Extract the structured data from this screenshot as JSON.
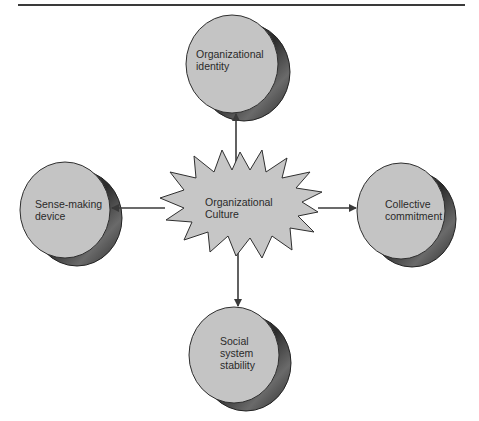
{
  "diagram": {
    "center": {
      "label_line1": "Organizational",
      "label_line2": "Culture"
    },
    "nodes": [
      {
        "id": "top",
        "line1": "Organizational",
        "line2": "identity",
        "line3": ""
      },
      {
        "id": "left",
        "line1": "Sense-making",
        "line2": "device",
        "line3": ""
      },
      {
        "id": "right",
        "line1": "Collective",
        "line2": "commitment",
        "line3": ""
      },
      {
        "id": "bottom",
        "line1": "Social",
        "line2": "system",
        "line3": "stability"
      }
    ],
    "colors": {
      "node_face": "#c4c4c4",
      "node_side": "#3a3a3a",
      "starburst_fill": "#c6c6c6",
      "stroke": "#2f2f2f",
      "arrow": "#3a3a3a"
    }
  }
}
